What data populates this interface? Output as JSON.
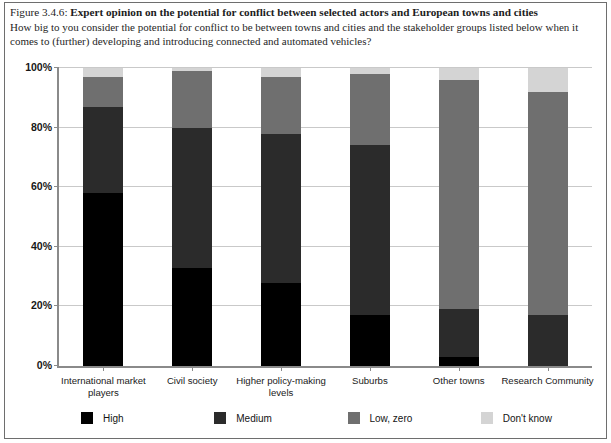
{
  "caption": {
    "figure_number": "Figure 3.4.6:",
    "title": "Expert opinion on the potential for conflict between selected actors and European towns and cities",
    "question": "How big to you consider the potential for conflict to be between towns and cities and the stakeholder groups listed below when it comes to (further) developing and introducing connected and automated vehicles?"
  },
  "colors": {
    "high": "#000000",
    "medium": "#2b2b2b",
    "low_zero": "#6f6f6f",
    "dont_know": "#d4d4d4",
    "axis": "#8a8a8a",
    "grid": "#c9c9c9",
    "border": "#6e6e6e"
  },
  "chart_data": {
    "type": "bar",
    "stacked": true,
    "stack_total": 100,
    "title": "Expert opinion on the potential for conflict between selected actors and European towns and cities",
    "xlabel": "",
    "ylabel": "",
    "ylim": [
      0,
      100
    ],
    "yticks": [
      "0%",
      "20%",
      "40%",
      "60%",
      "80%",
      "100%"
    ],
    "ytick_values": [
      0,
      20,
      40,
      60,
      80,
      100
    ],
    "grid": true,
    "legend_position": "bottom",
    "categories": [
      "International market players",
      "Civil society",
      "Higher policy-making levels",
      "Suburbs",
      "Other towns",
      "Research Community"
    ],
    "series": [
      {
        "name": "High",
        "color": "#000000",
        "values": [
          58,
          33,
          28,
          17,
          3,
          0
        ]
      },
      {
        "name": "Medium",
        "color": "#2b2b2b",
        "values": [
          29,
          47,
          50,
          57,
          16,
          17
        ]
      },
      {
        "name": "Low, zero",
        "color": "#6f6f6f",
        "values": [
          10,
          19,
          19,
          24,
          77,
          75
        ]
      },
      {
        "name": "Don't know",
        "color": "#d4d4d4",
        "values": [
          3,
          1,
          3,
          2,
          4,
          8
        ]
      }
    ]
  },
  "legend": {
    "items": [
      {
        "label": "High",
        "color": "#000000"
      },
      {
        "label": "Medium",
        "color": "#2b2b2b"
      },
      {
        "label": "Low, zero",
        "color": "#6f6f6f"
      },
      {
        "label": "Don't know",
        "color": "#d4d4d4"
      }
    ]
  }
}
